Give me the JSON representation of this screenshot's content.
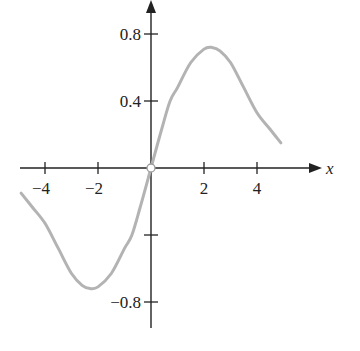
{
  "chart_data": {
    "type": "line",
    "title": "",
    "xlabel": "x",
    "ylabel": "",
    "xlim": [
      -4.95,
      6.5
    ],
    "ylim": [
      -0.96,
      1.0
    ],
    "grid": false,
    "legend": null,
    "x_ticks": [
      -4,
      -2,
      2,
      4
    ],
    "x_tick_labels": [
      "−4",
      "−2",
      "2",
      "4"
    ],
    "y_ticks": [
      0.8,
      0.4,
      -0.4,
      -0.8
    ],
    "y_tick_labels": [
      "0.8",
      "0.4",
      "",
      "−0.8"
    ],
    "annotations": [
      {
        "type": "open-circle",
        "x": 0,
        "y": 0,
        "note": "hole at origin"
      }
    ],
    "series": [
      {
        "name": "f(x)",
        "color": "#b3b3b3",
        "x": [
          -4.9,
          -4.5,
          -4.0,
          -3.5,
          -3.0,
          -2.6,
          -2.3,
          -2.0,
          -1.5,
          -1.0,
          -0.72,
          -0.4,
          0.0,
          0.4,
          0.72,
          1.0,
          1.5,
          2.0,
          2.3,
          2.6,
          3.0,
          3.5,
          4.0,
          4.5,
          4.9
        ],
        "y": [
          -0.15,
          -0.23,
          -0.33,
          -0.48,
          -0.63,
          -0.7,
          -0.72,
          -0.71,
          -0.63,
          -0.48,
          -0.4,
          -0.23,
          0.0,
          0.23,
          0.4,
          0.48,
          0.63,
          0.71,
          0.72,
          0.7,
          0.63,
          0.48,
          0.33,
          0.23,
          0.15
        ]
      }
    ]
  },
  "colors": {
    "axis": "#222222",
    "curve": "#b3b3b3",
    "background": "#ffffff"
  }
}
